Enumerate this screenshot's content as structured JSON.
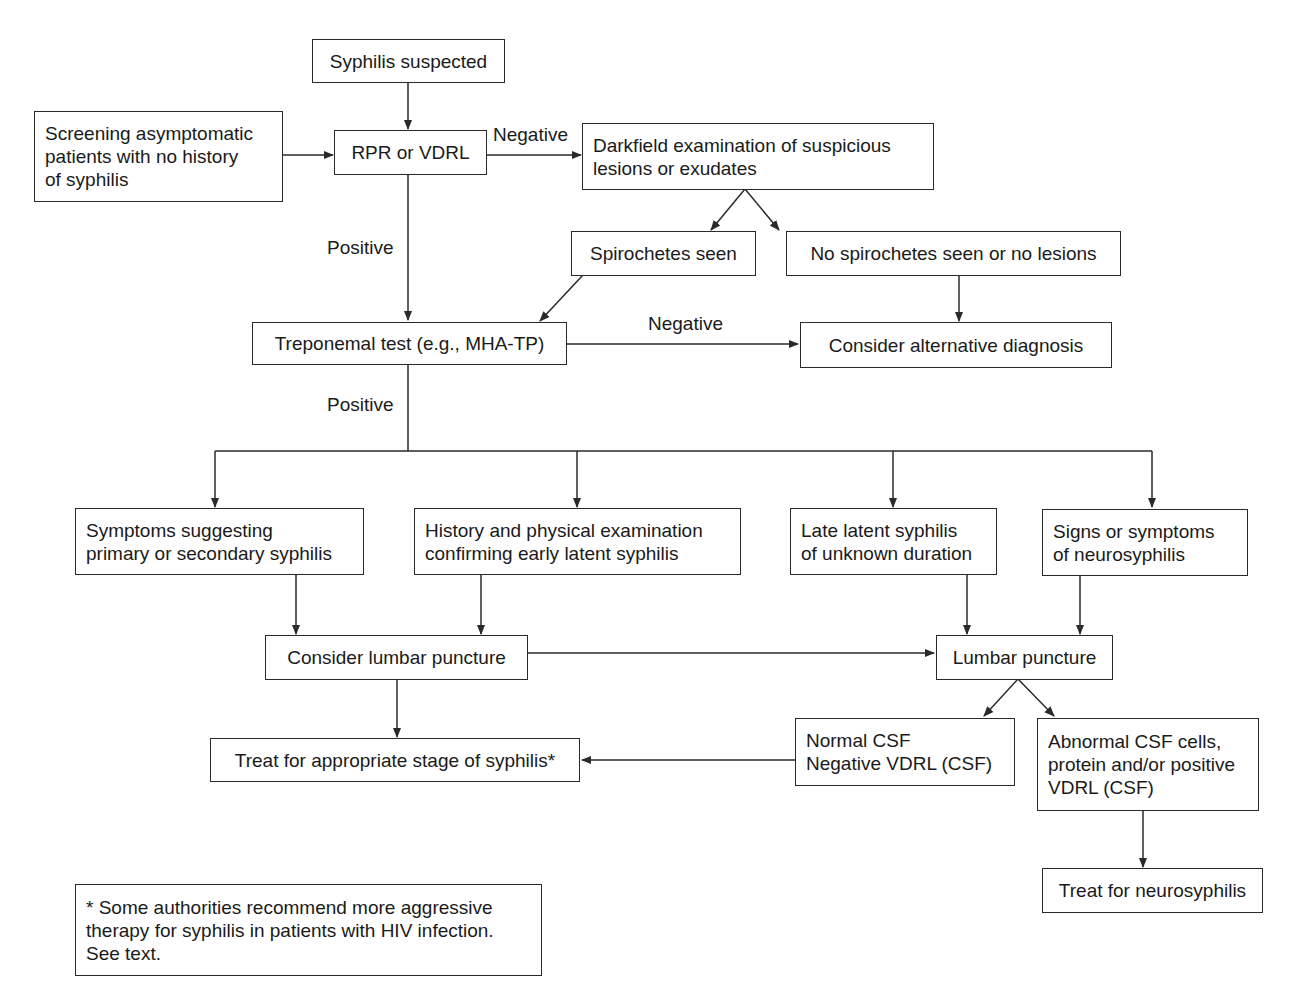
{
  "diagram": {
    "type": "flowchart",
    "colors": {
      "stroke": "#2a2a2a",
      "background": "#ffffff",
      "text": "#1a1a1a"
    },
    "nodes": {
      "suspected": {
        "lines": [
          "Syphilis suspected"
        ]
      },
      "screening": {
        "lines": [
          "Screening asymptomatic",
          "patients with no history",
          "of syphilis"
        ]
      },
      "rpr": {
        "lines": [
          "RPR or VDRL"
        ]
      },
      "darkfield": {
        "lines": [
          "Darkfield examination of suspicious",
          "lesions or exudates"
        ]
      },
      "spiro_seen": {
        "lines": [
          "Spirochetes seen"
        ]
      },
      "no_spiro": {
        "lines": [
          "No spirochetes seen or no lesions"
        ]
      },
      "treponemal": {
        "lines": [
          "Treponemal test (e.g., MHA-TP)"
        ]
      },
      "alternative": {
        "lines": [
          "Consider alternative diagnosis"
        ]
      },
      "primary_secondary": {
        "lines": [
          "Symptoms suggesting",
          "primary or secondary syphilis"
        ]
      },
      "early_latent": {
        "lines": [
          "History and physical examination",
          "confirming early latent syphilis"
        ]
      },
      "late_latent": {
        "lines": [
          "Late latent syphilis",
          "of unknown duration"
        ]
      },
      "neuro_signs": {
        "lines": [
          "Signs or symptoms",
          "of neurosyphilis"
        ]
      },
      "consider_lp": {
        "lines": [
          "Consider lumbar puncture"
        ]
      },
      "lp": {
        "lines": [
          "Lumbar puncture"
        ]
      },
      "treat_stage": {
        "lines": [
          "Treat for appropriate stage of syphilis*"
        ]
      },
      "normal_csf": {
        "lines": [
          "Normal CSF",
          "Negative VDRL (CSF)"
        ]
      },
      "abnormal_csf": {
        "lines": [
          "Abnormal CSF cells,",
          "protein and/or positive",
          "VDRL (CSF)"
        ]
      },
      "treat_neuro": {
        "lines": [
          "Treat for neurosyphilis"
        ]
      },
      "footnote": {
        "lines": [
          "* Some authorities recommend more aggressive",
          "therapy for syphilis in patients with HIV infection.",
          "See text."
        ]
      }
    },
    "edge_labels": {
      "rpr_negative": "Negative",
      "rpr_positive": "Positive",
      "treponemal_negative": "Negative",
      "treponemal_positive": "Positive"
    },
    "edges": [
      [
        "suspected",
        "rpr"
      ],
      [
        "screening",
        "rpr"
      ],
      [
        "rpr",
        "darkfield",
        "Negative"
      ],
      [
        "rpr",
        "treponemal",
        "Positive"
      ],
      [
        "darkfield",
        "spiro_seen"
      ],
      [
        "darkfield",
        "no_spiro"
      ],
      [
        "spiro_seen",
        "treponemal"
      ],
      [
        "no_spiro",
        "alternative"
      ],
      [
        "treponemal",
        "alternative",
        "Negative"
      ],
      [
        "treponemal",
        "primary_secondary",
        "Positive"
      ],
      [
        "treponemal",
        "early_latent",
        "Positive"
      ],
      [
        "treponemal",
        "late_latent",
        "Positive"
      ],
      [
        "treponemal",
        "neuro_signs",
        "Positive"
      ],
      [
        "primary_secondary",
        "consider_lp"
      ],
      [
        "early_latent",
        "consider_lp"
      ],
      [
        "late_latent",
        "lp"
      ],
      [
        "neuro_signs",
        "lp"
      ],
      [
        "consider_lp",
        "lp"
      ],
      [
        "consider_lp",
        "treat_stage"
      ],
      [
        "lp",
        "normal_csf"
      ],
      [
        "lp",
        "abnormal_csf"
      ],
      [
        "normal_csf",
        "treat_stage"
      ],
      [
        "abnormal_csf",
        "treat_neuro"
      ]
    ]
  }
}
